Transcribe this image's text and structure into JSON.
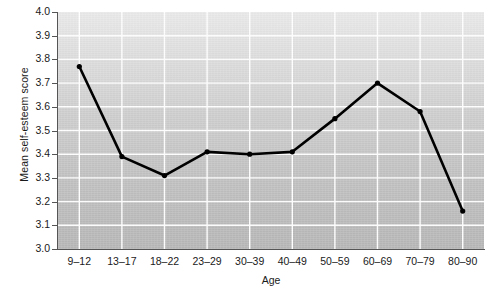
{
  "chart_data": {
    "type": "line",
    "title": "",
    "xlabel": "Age",
    "ylabel": "Mean self-esteem score",
    "categories": [
      "9–12",
      "13–17",
      "18–22",
      "23–29",
      "30–39",
      "40–49",
      "50–59",
      "60–69",
      "70–79",
      "80–90"
    ],
    "values": [
      3.77,
      3.39,
      3.31,
      3.41,
      3.4,
      3.41,
      3.55,
      3.7,
      3.58,
      3.16
    ],
    "series": [
      {
        "name": "Mean self-esteem score",
        "values": [
          3.77,
          3.39,
          3.31,
          3.41,
          3.4,
          3.41,
          3.55,
          3.7,
          3.58,
          3.16
        ]
      }
    ],
    "ylim": [
      3.0,
      4.0
    ],
    "yticks": [
      "3.0",
      "3.1",
      "3.2",
      "3.3",
      "3.4",
      "3.5",
      "3.6",
      "3.7",
      "3.8",
      "3.9",
      "4.0"
    ],
    "ytick_values": [
      3.0,
      3.1,
      3.2,
      3.3,
      3.4,
      3.5,
      3.6,
      3.7,
      3.8,
      3.9,
      4.0
    ],
    "grid": true,
    "grid_color": "#ffffff",
    "legend": "none",
    "line_color": "#000000",
    "marker": "circle",
    "plot_background": "#c8c8c8"
  }
}
